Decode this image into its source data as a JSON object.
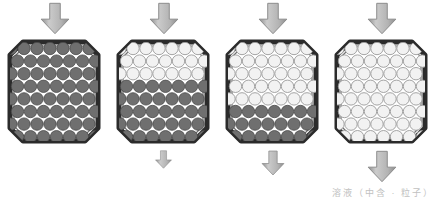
{
  "figure": {
    "caption": "溶液（中含 · 粒子）",
    "background_color": "#ffffff"
  },
  "palette": {
    "arrow_fill": "#b3b3b3",
    "arrow_fill_light": "#cccccc",
    "arrow_stroke": "#8c8c8c",
    "vessel_stroke": "#2b2b2b",
    "vessel_inner_stroke": "#6e6e6e",
    "vessel_fill": "#ffffff",
    "dark_particle_fill": "#6f6f6f",
    "dark_particle_stroke": "#4a4a4a",
    "light_particle_fill": "#f2f2f2",
    "light_particle_stroke": "#9a9a9a"
  },
  "grid": {
    "columns": 7,
    "rows": 8,
    "radius": 6.2,
    "x_step": 13.0,
    "y_step": 12.6,
    "x_origin": 11.0,
    "y_origin": 10.5,
    "row_offset": 6.5
  },
  "panels": [
    {
      "id": "panel-1",
      "index": 1,
      "label": "Stage 1",
      "x": 0,
      "top_arrow": {
        "present": true,
        "size": "large",
        "direction": "down"
      },
      "bottom_arrow": {
        "present": false,
        "size": "none",
        "direction": "down"
      },
      "light_rows": 0,
      "dark_rows": 8,
      "description": "All dark particles retained"
    },
    {
      "id": "panel-2",
      "index": 2,
      "label": "Stage 2",
      "x": 109,
      "top_arrow": {
        "present": true,
        "size": "large",
        "direction": "down"
      },
      "bottom_arrow": {
        "present": true,
        "size": "small",
        "direction": "down"
      },
      "light_rows": 3,
      "dark_rows": 5,
      "description": "Upper third cleared, lower portion dark"
    },
    {
      "id": "panel-3",
      "index": 3,
      "label": "Stage 3",
      "x": 218,
      "top_arrow": {
        "present": true,
        "size": "large",
        "direction": "down"
      },
      "bottom_arrow": {
        "present": true,
        "size": "medium",
        "direction": "down"
      },
      "light_rows": 5,
      "dark_rows": 3,
      "description": "Most particles cleared, bottom rows dark"
    },
    {
      "id": "panel-4",
      "index": 4,
      "label": "Stage 4",
      "x": 327,
      "top_arrow": {
        "present": true,
        "size": "large",
        "direction": "down"
      },
      "bottom_arrow": {
        "present": true,
        "size": "large",
        "direction": "down"
      },
      "light_rows": 8,
      "dark_rows": 0,
      "description": "All particles cleared"
    }
  ],
  "arrow_sizes": {
    "large": {
      "w": 34,
      "h": 33
    },
    "medium": {
      "w": 26,
      "h": 26
    },
    "small": {
      "w": 19,
      "h": 19
    },
    "none": {
      "w": 0,
      "h": 0
    }
  }
}
